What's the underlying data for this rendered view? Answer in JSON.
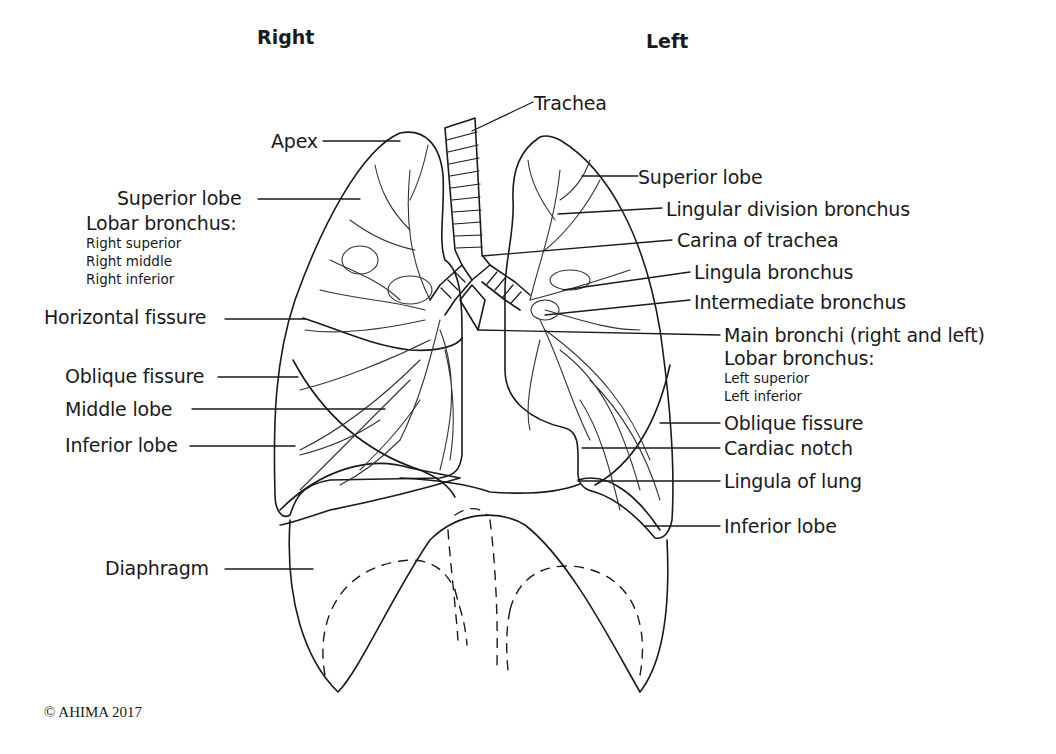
{
  "header": {
    "right_title": "Right",
    "left_title": "Left"
  },
  "labels_left": [
    {
      "id": "apex",
      "text": "Apex"
    },
    {
      "id": "superior-lobe-right",
      "text": "Superior lobe"
    },
    {
      "id": "lobar-bronchus-right",
      "text": "Lobar bronchus:"
    },
    {
      "id": "horizontal-fissure",
      "text": "Horizontal fissure"
    },
    {
      "id": "oblique-fissure-right",
      "text": "Oblique fissure"
    },
    {
      "id": "middle-lobe",
      "text": "Middle lobe"
    },
    {
      "id": "inferior-lobe-right",
      "text": "Inferior lobe"
    },
    {
      "id": "diaphragm",
      "text": "Diaphragm"
    }
  ],
  "lobar_right_items": [
    "Right superior",
    "Right middle",
    "Right inferior"
  ],
  "labels_right": [
    {
      "id": "trachea",
      "text": "Trachea"
    },
    {
      "id": "superior-lobe-left",
      "text": "Superior lobe"
    },
    {
      "id": "lingular-division-bronchus",
      "text": "Lingular division bronchus"
    },
    {
      "id": "carina",
      "text": "Carina of trachea"
    },
    {
      "id": "lingula-bronchus",
      "text": "Lingula bronchus"
    },
    {
      "id": "intermediate-bronchus",
      "text": "Intermediate bronchus"
    },
    {
      "id": "main-bronchi",
      "text": "Main bronchi (right and left)"
    },
    {
      "id": "lobar-bronchus-left",
      "text": "Lobar bronchus:"
    },
    {
      "id": "oblique-fissure-left",
      "text": "Oblique fissure"
    },
    {
      "id": "cardiac-notch",
      "text": "Cardiac notch"
    },
    {
      "id": "lingula-of-lung",
      "text": "Lingula of lung"
    },
    {
      "id": "inferior-lobe-left",
      "text": "Inferior lobe"
    }
  ],
  "lobar_left_items": [
    "Left superior",
    "Left inferior"
  ],
  "footer": {
    "copyright": "© AHIMA 2017"
  },
  "colors": {
    "line": "#1a1a1a",
    "background": "#ffffff"
  }
}
